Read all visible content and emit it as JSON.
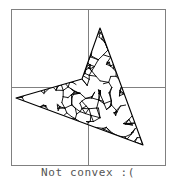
{
  "figure": {
    "caption": "Not convex :(",
    "caption_color": "#555555",
    "background_color": "#ffffff",
    "frame_color": "#808080",
    "axis_color": "#808080",
    "shape_stroke_color": "#000000",
    "shape_fill_color": "#ffffff",
    "frame": {
      "x": 11,
      "y": 9,
      "width": 154,
      "height": 156
    },
    "axes": {
      "vertical_x": 88,
      "horizontal_y": 87
    }
  },
  "chart_data": {
    "type": "scatter",
    "title": "Not convex :(",
    "xlabel": "",
    "ylabel": "",
    "grid": true,
    "legend": "none",
    "xlim": [
      11,
      165
    ],
    "ylim": [
      9,
      165
    ],
    "annotations": [
      "Not convex :("
    ],
    "polygon_name": "non-convex-polygon",
    "polygon_is_convex": false,
    "polygon_vertex_count": 4,
    "polygon_vertices": [
      {
        "label": "top-spike",
        "x": 100,
        "y": 28
      },
      {
        "label": "bottom-right-spike",
        "x": 143,
        "y": 145
      },
      {
        "label": "left-spike",
        "x": 16,
        "y": 98
      },
      {
        "label": "reflex-notch",
        "x": 82,
        "y": 79
      }
    ],
    "interior_mesh": {
      "description": "dense random line mesh filling polygon interior",
      "segment_count": 260,
      "stroke_width": 0.9,
      "color": "#000000"
    }
  }
}
